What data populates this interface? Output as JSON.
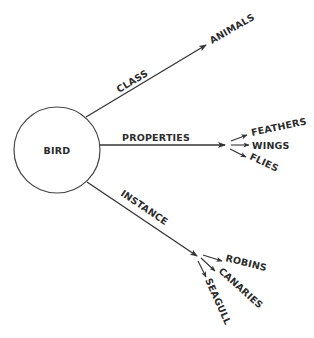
{
  "diagram": {
    "type": "semantic-network",
    "center_node": "BIRD",
    "relations": [
      {
        "label": "CLASS",
        "targets": [
          "ANIMALS"
        ]
      },
      {
        "label": "PROPERTIES",
        "targets": [
          "FEATHERS",
          "WINGS",
          "FLIES"
        ]
      },
      {
        "label": "INSTANCE",
        "targets": [
          "ROBINS",
          "CANARIES",
          "SEAGULL"
        ]
      }
    ]
  },
  "colors": {
    "line": "#333333",
    "text": "#2b2b2b",
    "background": "#ffffff"
  }
}
